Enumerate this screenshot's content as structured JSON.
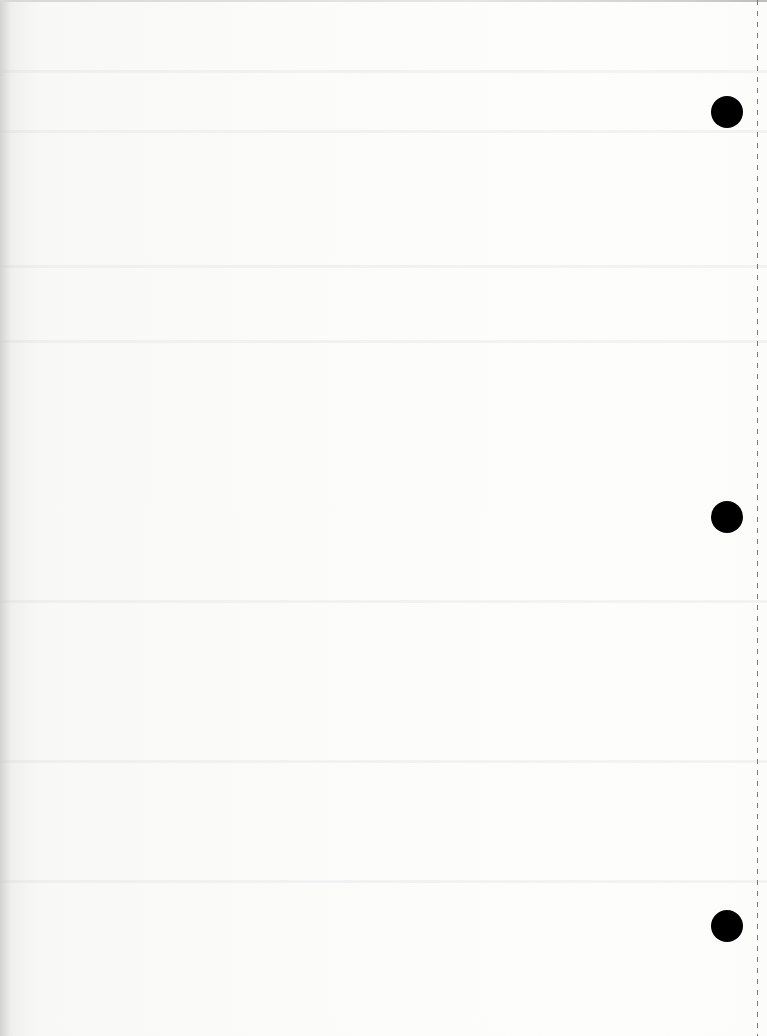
{
  "page": {
    "type": "blank-scanned-sheet",
    "background_color": "#fbfbfa",
    "text_content": ""
  },
  "punch_holes": [
    {
      "cx": 727,
      "cy": 112,
      "diameter": 32,
      "color": "#000000"
    },
    {
      "cx": 727,
      "cy": 517,
      "diameter": 32,
      "color": "#000000"
    },
    {
      "cx": 727,
      "cy": 926,
      "diameter": 32,
      "color": "#000000"
    }
  ],
  "perforation": {
    "x": 757,
    "style": "dashed",
    "color": "#7a7a78"
  }
}
